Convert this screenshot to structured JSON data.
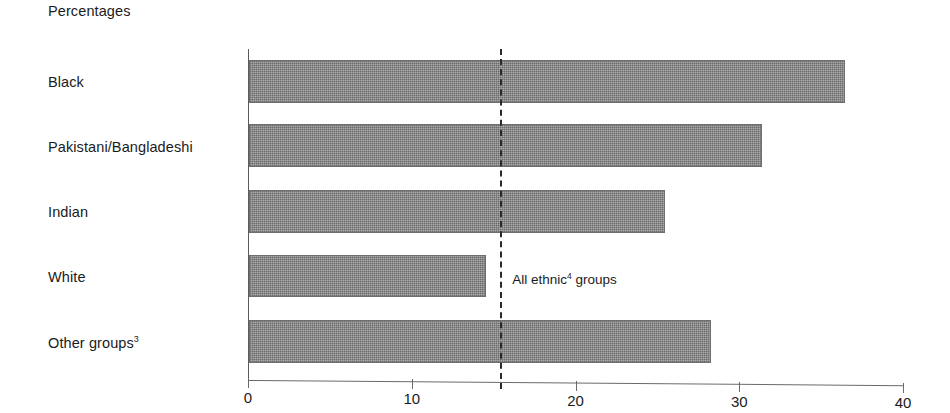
{
  "chart_data": {
    "type": "bar",
    "orientation": "horizontal",
    "title": "Percentages",
    "xlabel": "",
    "ylabel": "",
    "xlim": [
      0,
      40
    ],
    "grid": false,
    "legend": null,
    "xticks": [
      0,
      10,
      20,
      30,
      40
    ],
    "xtick_labels": [
      "0",
      "10",
      "20",
      "30",
      "40"
    ],
    "categories": [
      "Black",
      "Pakistani/Bangladeshi",
      "Indian",
      "White",
      "Other groups"
    ],
    "category_labels": [
      {
        "text": "Black",
        "superscript": ""
      },
      {
        "text": "Pakistani/Bangladeshi",
        "superscript": ""
      },
      {
        "text": "Indian",
        "superscript": ""
      },
      {
        "text": "White",
        "superscript": ""
      },
      {
        "text": "Other groups",
        "superscript": "3"
      }
    ],
    "values": [
      36.4,
      31.3,
      25.4,
      14.5,
      28.2
    ],
    "annotations": [
      {
        "type": "reference-line",
        "label": "All ethnic groups",
        "superscript": "4",
        "value": 15.4,
        "style": "dashed"
      }
    ]
  },
  "colors": {
    "bar_fill": "#949494",
    "bar_border": "#6f6f6f",
    "axis": "#6a6a6a",
    "text": "#1b1b1b",
    "reference_line": "#2a2a2a",
    "background": "#ffffff"
  }
}
